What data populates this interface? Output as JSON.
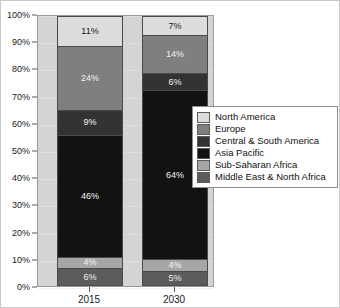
{
  "chart_data": {
    "type": "bar",
    "variant": "100-percent-stacked",
    "title": "",
    "subtitle": "",
    "xlabel": "",
    "ylabel": "",
    "categories": [
      "2015",
      "2030"
    ],
    "ylim": [
      0,
      100
    ],
    "ytick_labels": [
      "0%",
      "10%",
      "20%",
      "30%",
      "40%",
      "50%",
      "60%",
      "70%",
      "80%",
      "90%",
      "100%"
    ],
    "ytick_values": [
      0,
      10,
      20,
      30,
      40,
      50,
      60,
      70,
      80,
      90,
      100
    ],
    "grid": true,
    "legend_position": "right",
    "stack_order_bottom_to_top": [
      "Middle East & North Africa",
      "Sub-Saharan Africa",
      "Asia Pacific",
      "Central & South America",
      "Europe",
      "North America"
    ],
    "series": [
      {
        "name": "North America",
        "color": "#dcdcdc",
        "values": [
          11,
          7
        ],
        "labels": [
          "11%",
          "7%"
        ],
        "label_color": "#1a1a1a"
      },
      {
        "name": "Europe",
        "color": "#7f7f7f",
        "values": [
          24,
          14
        ],
        "labels": [
          "24%",
          "14%"
        ],
        "label_color": "#f2f2f2"
      },
      {
        "name": "Central & South America",
        "color": "#333333",
        "values": [
          9,
          6
        ],
        "labels": [
          "9%",
          "6%"
        ],
        "label_color": "#f2f2f2"
      },
      {
        "name": "Asia Pacific",
        "color": "#121212",
        "values": [
          46,
          64
        ],
        "labels": [
          "46%",
          "64%"
        ],
        "label_color": "#f2f2f2"
      },
      {
        "name": "Sub-Saharan Africa",
        "color": "#a6a6a6",
        "values": [
          4,
          4
        ],
        "labels": [
          "4%",
          "4%"
        ],
        "label_color": "#f2f2f2"
      },
      {
        "name": "Middle East & North Africa",
        "color": "#5c5c5c",
        "values": [
          6,
          5
        ],
        "labels": [
          "6%",
          "5%"
        ],
        "label_color": "#f2f2f2"
      }
    ]
  },
  "legend": {
    "entries": [
      {
        "label": "North America",
        "color": "#dcdcdc"
      },
      {
        "label": "Europe",
        "color": "#7f7f7f"
      },
      {
        "label": "Central & South America",
        "color": "#333333"
      },
      {
        "label": "Asia Pacific",
        "color": "#121212"
      },
      {
        "label": "Sub-Saharan Africa",
        "color": "#a6a6a6"
      },
      {
        "label": "Middle East & North Africa",
        "color": "#5c5c5c"
      }
    ]
  },
  "colors": {
    "plot_background": "#d4d4d4",
    "canvas_background": "#ffffff",
    "axis_line": "#5a5a5a",
    "segment_border": "#4a4a4a",
    "legend_border": "#8d8d8d"
  }
}
